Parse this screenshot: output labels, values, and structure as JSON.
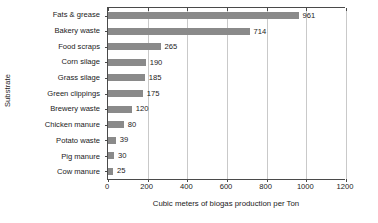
{
  "chart_data": {
    "type": "bar",
    "orientation": "horizontal",
    "title": "",
    "xlabel": "Cubic meters of biogas production per Ton",
    "ylabel": "Substrate",
    "categories": [
      "Fats & grease",
      "Bakery waste",
      "Food scraps",
      "Corn silage",
      "Grass silage",
      "Green clippings",
      "Brewery waste",
      "Chicken manure",
      "Potato waste",
      "Pig manure",
      "Cow manure"
    ],
    "values": [
      961,
      714,
      265,
      190,
      185,
      175,
      120,
      80,
      39,
      30,
      25
    ],
    "data_labels": [
      "961",
      "714",
      "265",
      "190",
      "185",
      "175",
      "120",
      "80",
      "39",
      "30",
      "25"
    ],
    "xlim": [
      0,
      1200
    ],
    "xticks": [
      0,
      200,
      400,
      600,
      800,
      1000,
      1200
    ],
    "xtick_labels": [
      "0",
      "200",
      "400",
      "600",
      "800",
      "1000",
      "1200"
    ],
    "grid": "vertical",
    "legend": "none",
    "bar_color": "#8a8a8a",
    "axis_color": "#4a4a4a",
    "gridline_color": "#c9c9c9",
    "background_color": "#ffffff"
  }
}
